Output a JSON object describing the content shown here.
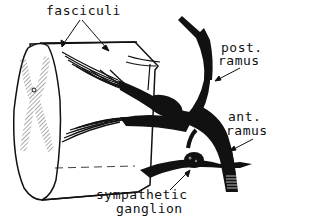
{
  "diagram": {
    "labels": {
      "fasciculi": "fasciculi",
      "post_ramus_line1": "post.",
      "post_ramus_line2": "ramus",
      "ant_ramus_line1": "ant.",
      "ant_ramus_line2": "ramus",
      "sympathetic_line1": "sympathetic",
      "sympathetic_line2": "ganglion"
    },
    "colors": {
      "ink": "#111111",
      "background": "#ffffff",
      "hatch": "#555555"
    }
  }
}
